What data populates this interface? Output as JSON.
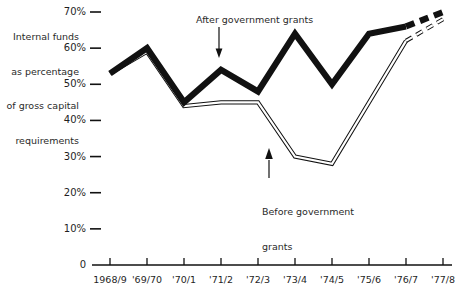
{
  "chart_data": {
    "type": "line",
    "title": "",
    "ylabel": "Internal funds as percentage of gross capital requirements",
    "xlabel": "",
    "ylim": [
      0,
      70
    ],
    "grid": false,
    "legend_position": "inline-annotations",
    "categories": [
      "1968/9",
      "'69/70",
      "'70/1",
      "'71/2",
      "'72/3",
      "'73/4",
      "'74/5",
      "'75/6",
      "'76/7",
      "'77/8"
    ],
    "series": [
      {
        "name": "After government grants",
        "style": "thick-solid-with-dashed-projection",
        "values": [
          53,
          60,
          45,
          54,
          48,
          64,
          50,
          64,
          66,
          70
        ],
        "dashed_from_index": 8
      },
      {
        "name": "Before government grants",
        "style": "thin-double-line-with-dashed-projection",
        "values": [
          53,
          59,
          44,
          45,
          45,
          30,
          28,
          45,
          62,
          68
        ],
        "dashed_from_index": 8
      }
    ],
    "y_ticks": [
      {
        "value": 70,
        "label": "70%"
      },
      {
        "value": 60,
        "label": "60%"
      },
      {
        "value": 50,
        "label": "50%"
      },
      {
        "value": 40,
        "label": "40%"
      },
      {
        "value": 30,
        "label": "30%"
      },
      {
        "value": 20,
        "label": "20%"
      },
      {
        "value": 10,
        "label": "10%"
      },
      {
        "value": 0,
        "label": "0"
      }
    ],
    "annotations": [
      {
        "name": "after-government-grants",
        "text": "After government grants",
        "arrow": "down"
      },
      {
        "name": "before-government-grants",
        "text_line1": "Before government",
        "text_line2": "grants",
        "arrow": "up"
      }
    ]
  },
  "axis_title": {
    "line1": "Internal funds",
    "line2": "as percentage",
    "line3": "of gross capital",
    "line4": "requirements"
  },
  "colors": {
    "ink": "#111111",
    "background": "#ffffff"
  }
}
